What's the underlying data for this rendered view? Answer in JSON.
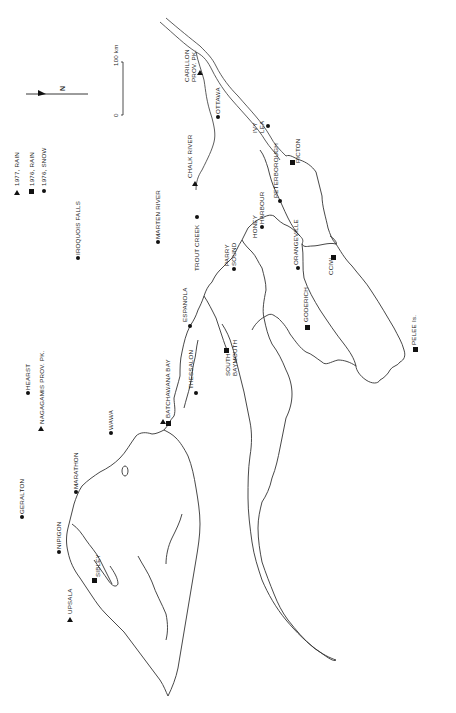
{
  "map": {
    "orientation": "rotated 90 degrees (north points left)",
    "north_arrow": {
      "label": "N"
    },
    "scale_bar": {
      "start_label": "0",
      "end_label": "100 km"
    },
    "legend": [
      {
        "symbol": "triangle",
        "label": "1977, RAIN"
      },
      {
        "symbol": "square",
        "label": "1976, RAIN"
      },
      {
        "symbol": "circle",
        "label": "1976, SNOW"
      }
    ],
    "sites": [
      {
        "name": "CARILLON PROV. PK.",
        "line1": "CARILLON",
        "line2": "PROV. PK.",
        "symbol": "triangle"
      },
      {
        "name": "OTTAWA",
        "symbol": "circle"
      },
      {
        "name": "CHALK RIVER",
        "symbol": "triangle"
      },
      {
        "name": "IVY LEA",
        "line1": "IVY",
        "line2": "LEA",
        "symbol": "circle"
      },
      {
        "name": "PICTON",
        "symbol": "square"
      },
      {
        "name": "PETERBOROUGH",
        "symbol": "circle"
      },
      {
        "name": "IROQUOIS FALLS",
        "symbol": "circle"
      },
      {
        "name": "MARTEN RIVER",
        "symbol": "circle"
      },
      {
        "name": "TROUT CREEK",
        "symbol": "circle"
      },
      {
        "name": "PARRY SOUND",
        "line1": "PARRY",
        "line2": "SOUND",
        "symbol": "circle"
      },
      {
        "name": "HONEY HARBOUR",
        "line1": "HONEY",
        "line2": "HARBOUR",
        "symbol": "circle"
      },
      {
        "name": "ORANGEVILLE",
        "symbol": "circle"
      },
      {
        "name": "CCIW",
        "symbol": "square"
      },
      {
        "name": "GODERICH",
        "symbol": "square"
      },
      {
        "name": "PELEE Is.",
        "line1": "PELEE",
        "line2": "Is.",
        "symbol": "square"
      },
      {
        "name": "ESPANOLA",
        "symbol": "circle"
      },
      {
        "name": "SOUTH BAYMOUTH",
        "line1": "SOUTH",
        "line2": "BAYMOUTH",
        "symbol": "square"
      },
      {
        "name": "THESSALON",
        "symbol": "circle"
      },
      {
        "name": "BATCHAWANA BAY",
        "symbol": "square"
      },
      {
        "name": "HEARST",
        "symbol": "circle"
      },
      {
        "name": "NAGAGAMIS PROV. PK.",
        "symbol": "triangle"
      },
      {
        "name": "WAWA",
        "symbol": "circle"
      },
      {
        "name": "GERALTON",
        "symbol": "circle"
      },
      {
        "name": "MARATHON",
        "symbol": "circle"
      },
      {
        "name": "NIPIGON",
        "symbol": "circle"
      },
      {
        "name": "SIBLEY",
        "symbol": "square"
      },
      {
        "name": "UPSALA",
        "symbol": "triangle"
      }
    ]
  }
}
